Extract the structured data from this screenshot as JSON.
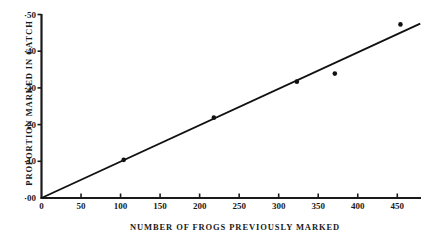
{
  "chart_data": {
    "type": "scatter",
    "title": "",
    "xlabel": "NUMBER OF FROGS PREVIOUSLY MARKED",
    "ylabel": "PROPORTION MARKED IN CATCH",
    "xlim": [
      0,
      480
    ],
    "ylim": [
      0.0,
      0.5
    ],
    "grid": false,
    "legend": null,
    "x_ticks": [
      0,
      50,
      100,
      150,
      200,
      250,
      300,
      350,
      400,
      450
    ],
    "x_tick_labels": [
      "0",
      "50",
      "100",
      "150",
      "200",
      "250",
      "300",
      "350",
      "400",
      "450"
    ],
    "y_ticks": [
      0.0,
      0.1,
      0.2,
      0.3,
      0.4,
      0.5
    ],
    "y_tick_labels": [
      "·00",
      "·10",
      "·20",
      "·30",
      "·40",
      "·50"
    ],
    "points": [
      {
        "x": 104,
        "y": 0.104
      },
      {
        "x": 218,
        "y": 0.219
      },
      {
        "x": 323,
        "y": 0.317
      },
      {
        "x": 371,
        "y": 0.339
      },
      {
        "x": 454,
        "y": 0.473
      }
    ],
    "series": [
      {
        "name": "observed proportions",
        "type": "scatter",
        "x": [
          104,
          218,
          323,
          371,
          454
        ],
        "values": [
          0.104,
          0.219,
          0.317,
          0.339,
          0.473
        ]
      },
      {
        "name": "fitted line",
        "type": "line",
        "x": [
          0,
          479
        ],
        "values": [
          0.0,
          0.475
        ]
      }
    ],
    "fit_line": {
      "x_start": 0,
      "y_start": 0.0,
      "x_end": 479,
      "y_end": 0.475
    },
    "colors": {
      "ink": "#1a1a1a",
      "background": "#ffffff",
      "marker": "#111111",
      "line": "#111111"
    }
  }
}
